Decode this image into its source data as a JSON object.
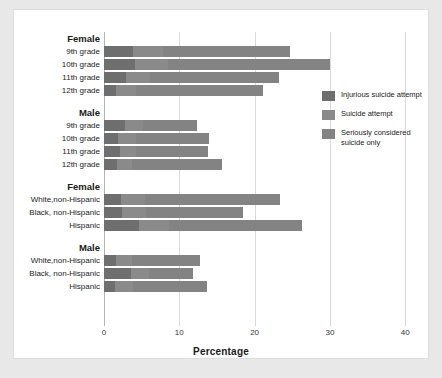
{
  "chart_data": {
    "type": "bar",
    "orientation": "horizontal",
    "stacked": true,
    "title": "",
    "xlabel": "Percentage",
    "ylabel": "",
    "xlim": [
      0,
      40
    ],
    "xticks": [
      0,
      10,
      20,
      30,
      40
    ],
    "xtick_labels": [
      "0",
      "10",
      "20",
      "30",
      "40"
    ],
    "grid": true,
    "legend_position": "right",
    "series": [
      {
        "name": "Injurious suicide attempt",
        "color": "#6e6e6e",
        "values": [
          3.9,
          4.1,
          2.9,
          1.6,
          2.8,
          1.9,
          2.1,
          1.7,
          2.3,
          2.4,
          4.6,
          1.6,
          3.6,
          1.5
        ]
      },
      {
        "name": "Suicide attempt",
        "color": "#8a8a8a",
        "values": [
          4.0,
          4.4,
          3.2,
          2.6,
          2.4,
          2.3,
          2.2,
          2.0,
          3.1,
          3.2,
          4.0,
          2.1,
          2.4,
          2.3
        ]
      },
      {
        "name": "Seriously considered suicide only",
        "color": "#838383",
        "values": [
          16.8,
          21.5,
          17.1,
          16.9,
          7.2,
          9.7,
          9.5,
          12.0,
          18.0,
          12.9,
          17.7,
          9.0,
          5.8,
          9.9
        ]
      }
    ],
    "groups": [
      {
        "header": "Female",
        "categories": [
          "9th grade",
          "10th grade",
          "11th grade",
          "12th grade"
        ],
        "totals": [
          24.7,
          30.0,
          23.2,
          21.1
        ]
      },
      {
        "header": "Male",
        "categories": [
          "9th grade",
          "10th grade",
          "11th grade",
          "12th grade"
        ],
        "totals": [
          12.4,
          13.9,
          13.8,
          15.7
        ]
      },
      {
        "header": "Female",
        "categories": [
          "White,non-Hispanic",
          "Black, non-Hispanic",
          "Hispanic"
        ],
        "totals": [
          23.4,
          18.5,
          26.3
        ]
      },
      {
        "header": "Male",
        "categories": [
          "White,non-Hispanic",
          "Black, non-Hispanic",
          "Hispanic"
        ],
        "totals": [
          12.7,
          11.8,
          13.7
        ]
      }
    ]
  },
  "axis": {
    "xlabel": "Percentage",
    "ticks": [
      "0",
      "10",
      "20",
      "30",
      "40"
    ]
  },
  "legend": {
    "items": [
      {
        "label": "Injurious suicide attempt",
        "color": "#6e6e6e"
      },
      {
        "label": "Suicide attempt",
        "color": "#8a8a8a"
      },
      {
        "label": "Seriously considered suicide only",
        "color": "#838383"
      }
    ]
  }
}
